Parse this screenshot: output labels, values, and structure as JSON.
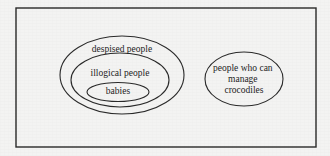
{
  "figure": {
    "background_color": "#f3f3f2",
    "ink_color": "#2a2a2a",
    "text_color": "#1d1d1d",
    "universe": {
      "name": "universe-box",
      "x": 16,
      "y": 8,
      "width": 300,
      "height": 139,
      "stroke_width": 1.4
    },
    "nested_group": {
      "label": "nested-sets-group",
      "sets": [
        {
          "id": "despised-people",
          "label": "despised people",
          "cx": 122,
          "cy": 75,
          "rx": 62,
          "ry": 39,
          "label_x": 122,
          "label_y": 50,
          "font_size": 9.5,
          "stroke_width": 1.1
        },
        {
          "id": "illogical-people",
          "label": "illogical people",
          "cx": 120,
          "cy": 80,
          "rx": 49,
          "ry": 27,
          "label_x": 120,
          "label_y": 74,
          "font_size": 9.5,
          "stroke_width": 1.1
        },
        {
          "id": "babies",
          "label": "babies",
          "cx": 118,
          "cy": 92,
          "rx": 31,
          "ry": 9.5,
          "label_x": 118,
          "label_y": 92,
          "font_size": 9.5,
          "stroke_width": 1.1
        }
      ]
    },
    "separate_group": {
      "label": "disjoint-set-group",
      "sets": [
        {
          "id": "people-who-can-manage-crocodiles",
          "label": "people who can manage crocodiles",
          "label_lines": [
            "people who can",
            "manage",
            "crocodiles"
          ],
          "cx": 244,
          "cy": 79,
          "rx": 39,
          "ry": 27,
          "label_x": 244,
          "label_y": 69,
          "line_height": 11,
          "font_size": 9.5,
          "stroke_width": 1.1
        }
      ]
    }
  }
}
